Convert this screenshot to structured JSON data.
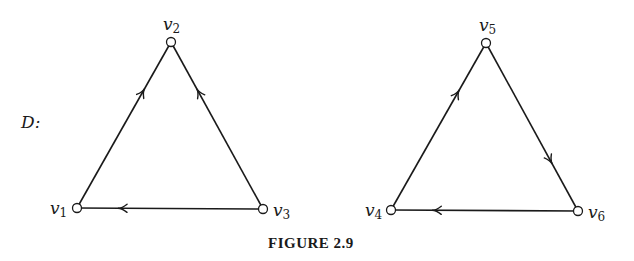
{
  "graph_label": "D:",
  "caption": "FIGURE 2.9",
  "nodes": [
    {
      "id": "v1",
      "base": "v",
      "sub": "1",
      "x": 77,
      "y": 208,
      "lx": 50,
      "ly": 214
    },
    {
      "id": "v2",
      "base": "v",
      "sub": "2",
      "x": 171,
      "y": 42,
      "lx": 163,
      "ly": 30
    },
    {
      "id": "v3",
      "base": "v",
      "sub": "3",
      "x": 263,
      "y": 209,
      "lx": 273,
      "ly": 216
    },
    {
      "id": "v4",
      "base": "v",
      "sub": "4",
      "x": 391,
      "y": 210,
      "lx": 365,
      "ly": 216
    },
    {
      "id": "v5",
      "base": "v",
      "sub": "5",
      "x": 486,
      "y": 43,
      "lx": 479,
      "ly": 31
    },
    {
      "id": "v6",
      "base": "v",
      "sub": "6",
      "x": 578,
      "y": 211,
      "lx": 588,
      "ly": 218
    }
  ],
  "edges": [
    {
      "from": "v1",
      "to": "v2"
    },
    {
      "from": "v3",
      "to": "v2"
    },
    {
      "from": "v3",
      "to": "v1"
    },
    {
      "from": "v4",
      "to": "v5"
    },
    {
      "from": "v5",
      "to": "v6"
    },
    {
      "from": "v6",
      "to": "v4"
    }
  ]
}
